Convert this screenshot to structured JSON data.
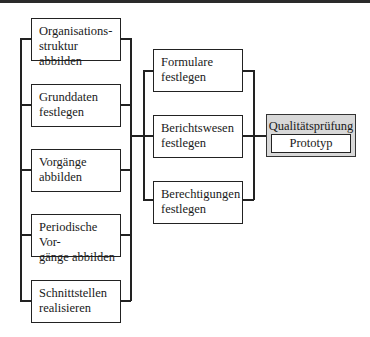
{
  "diagram": {
    "left_column": [
      {
        "label": "Organisations-\nstruktur abbilden",
        "line1": "Organisations-",
        "line2": "struktur abbilden"
      },
      {
        "label": "Grunddaten festlegen",
        "line1": "Grunddaten",
        "line2": "festlegen"
      },
      {
        "label": "Vorgänge abbilden",
        "line1": "Vorgänge",
        "line2": "abbilden"
      },
      {
        "label": "Periodische Vorgänge abbilden",
        "line1": "Periodische Vor-",
        "line2": "gänge abbilden"
      },
      {
        "label": "Schnittstellen realisieren",
        "line1": "Schnittstellen",
        "line2": "realisieren"
      }
    ],
    "middle_column": [
      {
        "label": "Formulare festlegen",
        "line1": "Formulare",
        "line2": "festlegen"
      },
      {
        "label": "Berichtswesen festlegen",
        "line1": "Berichtswesen",
        "line2": "festlegen"
      },
      {
        "label": "Berechtigungen festlegen",
        "line1": "Berechtigungen",
        "line2": "festlegen"
      }
    ],
    "result": {
      "title": "Qualitätsprüfung",
      "inner_label": "Prototyp",
      "fill_color": "#d8d8d8"
    },
    "colors": {
      "line": "#222222",
      "box_fill": "#ffffff"
    }
  }
}
